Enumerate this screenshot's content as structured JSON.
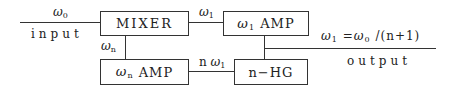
{
  "diagram": {
    "title": "",
    "blocks": {
      "mixer": {
        "label": "MIXER"
      },
      "omega1_amp": {
        "symbol": "ω",
        "sub": "1",
        "label": "AMP"
      },
      "omegan_amp": {
        "symbol": "ω",
        "sub": "n",
        "label": "AMP"
      },
      "nhg": {
        "label": "n−HG"
      }
    },
    "signals": {
      "input": {
        "symbol": "ω",
        "sub": "0",
        "caption": "input"
      },
      "mixer_to_amp": {
        "symbol": "ω",
        "sub": "1"
      },
      "mixer_to_namp": {
        "symbol": "ω",
        "sub": "n"
      },
      "hg_to_namp": {
        "prefix": "n",
        "symbol": "ω",
        "sub": "1"
      },
      "output": {
        "symbol": "ω",
        "sub": "1",
        "equation_rest": " =",
        "symbol2": "ω",
        "sub2": "0",
        "equation_tail": " /(n+1)",
        "caption": "output"
      }
    },
    "connections": [
      [
        "input",
        "MIXER"
      ],
      [
        "MIXER",
        "ω1 AMP"
      ],
      [
        "MIXER",
        "ωn AMP"
      ],
      [
        "ωn AMP",
        "n−HG"
      ],
      [
        "ω1 AMP",
        "n−HG"
      ],
      [
        "ω1 AMP",
        "output"
      ]
    ]
  }
}
